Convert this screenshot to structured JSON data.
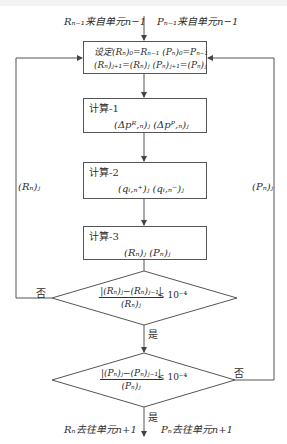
{
  "diagram": {
    "type": "flowchart",
    "inputs": {
      "left": "Rₙ₋₁来自单元n−1",
      "right": "Pₙ₋₁来自单元n−1"
    },
    "init_box": {
      "line1": "设定(Rₙ)₀=Rₙ₋₁ (Pₙ)₀=Pₙ₋₁",
      "line2": "(Rₙ)ⱼ₊₁=(Rₙ)ⱼ (Pₙ)ⱼ₊₁=(Pₙ)ⱼ"
    },
    "calc1": {
      "title": "计算-1",
      "vars": "(Δpᴿ,ₙ)ⱼ  (Δpᴾ,ₙ)ⱼ"
    },
    "calc2": {
      "title": "计算-2",
      "vars": "(qᵢ,ₙ⁺)ⱼ  (qᵢ,ₙ⁻)ⱼ"
    },
    "calc3": {
      "title": "计算-3",
      "vars": "(Rₙ)ⱼ    (Pₙ)ⱼ"
    },
    "decision1": {
      "numerator": "|(Rₙ)ⱼ−(Rₙ)ⱼ₋₁|",
      "denominator": "(Rₙ)ⱼ",
      "condition": "≤ 10⁻⁴",
      "no_label": "否",
      "yes_label": "是"
    },
    "decision2": {
      "numerator": "|(Pₙ)ⱼ−(Pₙ)ⱼ₋₁|",
      "denominator": "(Pₙ)ⱼ",
      "condition": "≤ 10⁻⁴",
      "no_label": "否",
      "yes_label": "是"
    },
    "loop_labels": {
      "left": "(Rₙ)ⱼ",
      "right": "(Pₙ)ⱼ"
    },
    "outputs": {
      "left": "Rₙ去往单元n+1",
      "right": "Pₙ去往单元n+1"
    }
  }
}
